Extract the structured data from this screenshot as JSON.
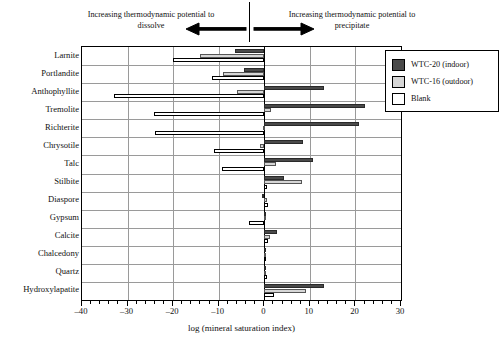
{
  "annotations": {
    "left": "Increasing thermodynamic potential to dissolve",
    "right": "Increasing thermodynamic potential to precipitate",
    "left_icon": "left-arrow-icon",
    "right_icon": "right-arrow-icon"
  },
  "legend": {
    "position": "top-right",
    "items": [
      {
        "label": "WTC-20 (indoor)",
        "color": "#4a4a4a",
        "swatch": "dark-gray-swatch"
      },
      {
        "label": "WTC-16 (outdoor)",
        "color": "#d6d6d6",
        "swatch": "light-gray-swatch"
      },
      {
        "label": "Blank",
        "color": "#ffffff",
        "swatch": "white-swatch"
      }
    ]
  },
  "chart_data": {
    "type": "bar",
    "orientation": "horizontal",
    "title": "",
    "subtitle": "",
    "xlabel": "log (mineral saturation index)",
    "ylabel": "",
    "xlim": [
      -40,
      30
    ],
    "xticks": [
      -40,
      -30,
      -20,
      -10,
      0,
      10,
      20,
      30
    ],
    "xticklabels": [
      "–40",
      "–30",
      "–20",
      "–10",
      "0",
      "10",
      "20",
      "30"
    ],
    "minor_tick_step": 2,
    "grid": "horizontal-and-vertical",
    "zero_reference_line": 0,
    "legend_position": "upper right",
    "categories": [
      "Larnite",
      "Portlandite",
      "Anthophyllite",
      "Tremolite",
      "Richterite",
      "Chrysotile",
      "Talc",
      "Stilbite",
      "Diaspore",
      "Gypsum",
      "Calcite",
      "Chalcedony",
      "Quartz",
      "Hydroxylapatite"
    ],
    "series": [
      {
        "name": "WTC-20 (indoor)",
        "color": "#4a4a4a",
        "values": [
          -6.5,
          -4.5,
          13.0,
          22.0,
          20.8,
          8.5,
          10.6,
          4.3,
          -0.6,
          -0.1,
          2.8,
          0.1,
          -0.1,
          13.2
        ]
      },
      {
        "name": "WTC-16 (outdoor)",
        "color": "#d6d6d6",
        "values": [
          -14.0,
          -9.0,
          -6.0,
          1.4,
          -0.3,
          -0.9,
          2.6,
          8.3,
          0.7,
          -0.1,
          1.3,
          0.4,
          0.4,
          9.1
        ]
      },
      {
        "name": "Blank",
        "color": "#ffffff",
        "values": [
          -20.0,
          -11.5,
          -33.0,
          -24.3,
          -24.0,
          -11.0,
          -9.2,
          0.6,
          0.8,
          -3.3,
          0.9,
          0.3,
          0.5,
          2.1
        ]
      }
    ]
  }
}
